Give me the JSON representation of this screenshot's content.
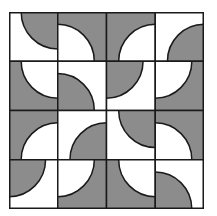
{
  "figure": {
    "type": "tile-pattern",
    "rows": 4,
    "cols": 4,
    "colors": {
      "dark": "#8c8c8c",
      "light": "#ffffff",
      "stroke": "#1a1a1a"
    },
    "arc_radius_ratio": 0.75,
    "tiles": [
      [
        {
          "corner": "tr",
          "disc": "dark"
        },
        {
          "corner": "bl",
          "disc": "light"
        },
        {
          "corner": "br",
          "disc": "light"
        },
        {
          "corner": "br",
          "disc": "dark"
        }
      ],
      [
        {
          "corner": "tr",
          "disc": "light"
        },
        {
          "corner": "bl",
          "disc": "dark"
        },
        {
          "corner": "tl",
          "disc": "dark"
        },
        {
          "corner": "tl",
          "disc": "light"
        }
      ],
      [
        {
          "corner": "br",
          "disc": "light"
        },
        {
          "corner": "br",
          "disc": "dark"
        },
        {
          "corner": "tr",
          "disc": "dark"
        },
        {
          "corner": "bl",
          "disc": "light"
        }
      ],
      [
        {
          "corner": "tl",
          "disc": "dark"
        },
        {
          "corner": "tl",
          "disc": "light"
        },
        {
          "corner": "tr",
          "disc": "light"
        },
        {
          "corner": "bl",
          "disc": "dark"
        }
      ]
    ]
  }
}
